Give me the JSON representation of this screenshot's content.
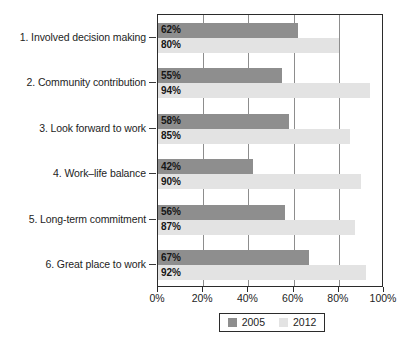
{
  "chart_data": {
    "type": "bar",
    "orientation": "horizontal",
    "title": "",
    "subtitle": "",
    "xlabel": "",
    "ylabel": "",
    "xlim": [
      0,
      100
    ],
    "xticks": [
      0,
      20,
      40,
      60,
      80,
      100
    ],
    "xtick_labels": [
      "0%",
      "20%",
      "40%",
      "60%",
      "80%",
      "100%"
    ],
    "grid": true,
    "grid_axis": "x",
    "legend_position": "bottom",
    "categories": [
      "1. Involved decision making",
      "2. Community contribution",
      "3. Look forward to work",
      "4. Work–life balance",
      "5. Long-term commitment",
      "6. Great place to work"
    ],
    "series": [
      {
        "name": "2005",
        "color": "#8e8e8e",
        "values": [
          62,
          55,
          58,
          42,
          56,
          67
        ],
        "labels": [
          "62%",
          "55%",
          "58%",
          "42%",
          "56%",
          "67%"
        ]
      },
      {
        "name": "2012",
        "color": "#e3e3e3",
        "values": [
          80,
          94,
          85,
          90,
          87,
          92
        ],
        "labels": [
          "80%",
          "94%",
          "85%",
          "90%",
          "87%",
          "92%"
        ]
      }
    ]
  },
  "legend": {
    "entries": [
      {
        "label": "2005",
        "color": "#8e8e8e"
      },
      {
        "label": "2012",
        "color": "#e3e3e3"
      }
    ]
  }
}
